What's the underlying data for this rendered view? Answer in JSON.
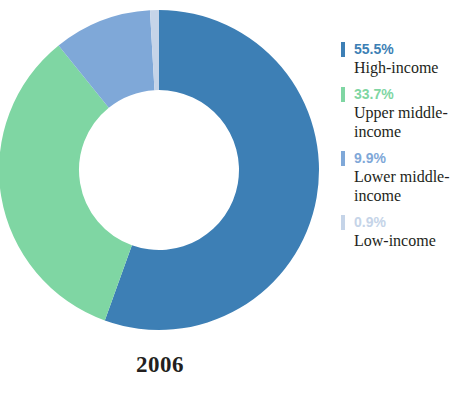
{
  "caption": {
    "year": "2006"
  },
  "legend": {
    "entries": [
      {
        "percent": "55.5%",
        "label": "High-income",
        "color": "#3d7fb5"
      },
      {
        "percent": "33.7%",
        "label": "Upper middle-income",
        "color": "#7fd6a3"
      },
      {
        "percent": "9.9%",
        "label": "Lower middle-income",
        "color": "#7fa8d8"
      },
      {
        "percent": "0.9%",
        "label": "Low-income",
        "color": "#c5d4e8"
      }
    ]
  },
  "chart_data": {
    "type": "pie",
    "title": "2006",
    "subtitle": "",
    "xlabel": "",
    "ylabel": "",
    "donut": true,
    "hole_ratio": 0.5,
    "start_angle_deg": 0,
    "direction": "clockwise",
    "legend_position": "right",
    "grid": false,
    "units": "percent",
    "total": 100.0,
    "categories": [
      "High-income",
      "Upper middle-income",
      "Lower middle-income",
      "Low-income"
    ],
    "values": [
      55.5,
      33.7,
      9.9,
      0.9
    ],
    "labels": [
      "55.5%",
      "33.7%",
      "9.9%",
      "0.9%"
    ],
    "colors": [
      "#3d7fb5",
      "#7fd6a3",
      "#7fa8d8",
      "#c5d4e8"
    ]
  }
}
